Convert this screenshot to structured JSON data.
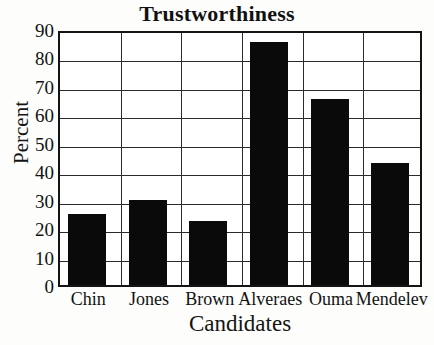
{
  "chart_data": {
    "type": "bar",
    "title": "Trustworthiness",
    "xlabel": "Candidates",
    "ylabel": "Percent",
    "categories": [
      "Chin",
      "Jones",
      "Brown",
      "Alveraes",
      "Ouma",
      "Mendelev"
    ],
    "values": [
      25,
      30,
      22.5,
      85.5,
      65.5,
      43
    ],
    "series": [
      {
        "name": "Percent",
        "values": [
          25,
          30,
          22.5,
          85.5,
          65.5,
          43
        ]
      }
    ],
    "ylim": [
      0,
      90
    ],
    "ytick_values": [
      0,
      10,
      20,
      30,
      40,
      50,
      60,
      70,
      80,
      90
    ],
    "ytick_labels": [
      "0",
      "10",
      "20",
      "30",
      "40",
      "50",
      "60",
      "70",
      "80",
      "90"
    ],
    "grid": "horizontal-and-vertical",
    "legend": "none",
    "bar_color": "#0a0a0a",
    "axis_color": "#141414",
    "background_color": "#ffffff"
  }
}
